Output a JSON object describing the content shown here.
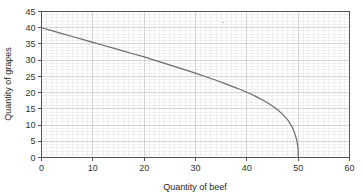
{
  "chart_data": {
    "type": "line",
    "title": "",
    "subtitle": "",
    "xlabel": "Quantity of beef",
    "ylabel": "Quantity of grapes",
    "xlim": [
      0,
      60
    ],
    "ylim": [
      0,
      45
    ],
    "xticks": [
      0,
      10,
      20,
      30,
      40,
      50,
      60
    ],
    "yticks": [
      0,
      5,
      10,
      15,
      20,
      25,
      30,
      35,
      40,
      45
    ],
    "xtick_labels": [
      "0",
      "10",
      "20",
      "30",
      "40",
      "50",
      "60"
    ],
    "ytick_labels": [
      "0",
      "5",
      "10",
      "15",
      "20",
      "25",
      "30",
      "35",
      "40",
      "45"
    ],
    "grid": true,
    "minor_grid": true,
    "minor_grid_step_x": 1,
    "minor_grid_step_y": 1,
    "legend": false,
    "legend_position": "none",
    "annotations": [],
    "series": [
      {
        "name": "Production possibility frontier",
        "color": "#6b6b6b",
        "line_width": 1.2,
        "x": [
          0,
          2,
          4,
          6,
          8,
          10,
          12,
          14,
          16,
          18,
          20,
          22,
          24,
          26,
          28,
          30,
          32,
          34,
          36,
          38,
          40,
          41,
          42,
          43,
          44,
          45,
          46,
          47,
          48,
          48.5,
          49,
          49.3,
          49.6,
          49.8,
          49.9,
          50,
          50,
          50
        ],
        "values": [
          40,
          39.1,
          38.2,
          37.3,
          36.4,
          35.5,
          34.6,
          33.7,
          32.8,
          31.9,
          31.0,
          30.0,
          29.0,
          28.0,
          27.0,
          26.0,
          24.9,
          23.8,
          22.6,
          21.4,
          20.1,
          19.4,
          18.6,
          17.8,
          16.9,
          15.9,
          14.7,
          13.3,
          11.5,
          10.3,
          8.8,
          7.6,
          6.1,
          4.7,
          3.7,
          2.2,
          1.0,
          0
        ]
      }
    ],
    "colors": {
      "curve": "#6b6b6b",
      "axis": "#555555",
      "major_grid": "#c8c8c8",
      "minor_grid": "#e4e4e4",
      "plot_background": "#ffffff",
      "text": "#2b2b2b"
    },
    "speck_artifact": {
      "x": 35.5,
      "y": 41.5
    }
  },
  "axes": {
    "x_title": "Quantity of beef",
    "y_title": "Quantity of grapes"
  }
}
